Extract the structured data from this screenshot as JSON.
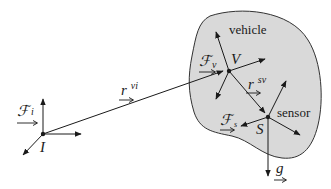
{
  "diagram": {
    "type": "reference-frames",
    "body_region": {
      "label": "vehicle",
      "fill": "#d9d9d9",
      "stroke": "#333333"
    },
    "frames": [
      {
        "id": "inertial",
        "origin_label": "I",
        "frame_symbol": "ℱ",
        "frame_sub": "i"
      },
      {
        "id": "vehicle",
        "origin_label": "V",
        "frame_symbol": "ℱ",
        "frame_sub": "v"
      },
      {
        "id": "sensor",
        "origin_label": "S",
        "frame_symbol": "ℱ",
        "frame_sub": "s"
      }
    ],
    "vectors": [
      {
        "id": "r_vi",
        "symbol": "r",
        "sup": "vi",
        "from": "I",
        "to": "V"
      },
      {
        "id": "r_sv",
        "symbol": "r",
        "sup": "sv",
        "from": "V",
        "to": "S"
      },
      {
        "id": "g",
        "symbol": "g",
        "sup": "",
        "from": "S",
        "to": "down"
      }
    ],
    "labels": {
      "vehicle": "vehicle",
      "sensor": "sensor"
    },
    "colors": {
      "line": "#1a1a1a",
      "body_fill": "#d9d9d9"
    }
  }
}
